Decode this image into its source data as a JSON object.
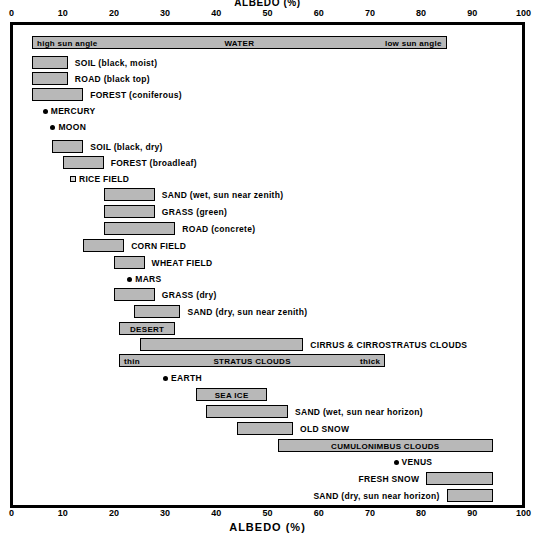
{
  "titles": {
    "top": "ALBEDO (%)",
    "bottom": "ALBEDO (%)"
  },
  "axis": {
    "label": "ALBEDO (%)",
    "ticks": [
      0,
      10,
      20,
      30,
      40,
      50,
      60,
      70,
      80,
      90,
      100
    ],
    "min": 0,
    "max": 100,
    "unit": "%"
  },
  "colors": {
    "bar_fill": "#b8b8b8",
    "bar_border": "#000000",
    "background": "#ffffff",
    "text": "#000000"
  },
  "chart_data": {
    "type": "bar",
    "orientation": "horizontal",
    "title": "ALBEDO (%)",
    "xlabel": "ALBEDO (%)",
    "ylabel": "",
    "xlim": [
      0,
      100
    ],
    "grid": false,
    "legend": null,
    "note": "Horizontal range (floating) bar chart of albedo percentages for surfaces, clouds and planets. Planets are single-value point markers.",
    "categories": [
      "WATER",
      "SOIL (black, moist)",
      "ROAD (black top)",
      "FOREST (coniferous)",
      "MERCURY",
      "MOON",
      "SOIL (black, dry)",
      "FOREST (broadleaf)",
      "RICE FIELD",
      "SAND (wet, sun near zenith)",
      "GRASS (green)",
      "ROAD (concrete)",
      "CORN FIELD",
      "WHEAT FIELD",
      "MARS",
      "GRASS (dry)",
      "SAND (dry, sun near zenith)",
      "DESERT",
      "CIRRUS & CIRROSTRATUS CLOUDS",
      "STRATUS CLOUDS",
      "EARTH",
      "SEA ICE",
      "SAND (wet, sun near horizon)",
      "OLD SNOW",
      "CUMULONIMBUS CLOUDS",
      "VENUS",
      "FRESH SNOW",
      "SAND (dry, sun near horizon)"
    ],
    "ranges": [
      [
        4,
        85
      ],
      [
        4,
        11
      ],
      [
        4,
        11
      ],
      [
        4,
        14
      ],
      [
        6.5,
        6.5
      ],
      [
        8,
        8
      ],
      [
        8,
        14
      ],
      [
        10,
        18
      ],
      [
        12,
        12
      ],
      [
        18,
        28
      ],
      [
        18,
        28
      ],
      [
        18,
        32
      ],
      [
        14,
        22
      ],
      [
        20,
        26
      ],
      [
        23,
        23
      ],
      [
        20,
        28
      ],
      [
        24,
        33
      ],
      [
        21,
        32
      ],
      [
        25,
        57
      ],
      [
        21,
        73
      ],
      [
        30,
        30
      ],
      [
        36,
        50
      ],
      [
        38,
        54
      ],
      [
        44,
        55
      ],
      [
        52,
        94
      ],
      [
        75,
        75
      ],
      [
        81,
        94
      ],
      [
        85,
        94
      ]
    ],
    "values": [
      44.5,
      7.5,
      7.5,
      9,
      6.5,
      8,
      11,
      14,
      12,
      23,
      23,
      25,
      18,
      23,
      23,
      24,
      28.5,
      26.5,
      41,
      47,
      30,
      43,
      46,
      49.5,
      73,
      75,
      87.5,
      89.5
    ]
  },
  "rows": [
    {
      "name": "water",
      "type": "bar",
      "start": 4,
      "end": 85,
      "y": 36,
      "label": "WATER",
      "label_pos": "center-inside",
      "sub_left": "high sun angle",
      "sub_right": "low sun angle",
      "dashed_mid": true
    },
    {
      "name": "soil-black-moist",
      "type": "bar",
      "start": 4,
      "end": 11,
      "y": 56,
      "label": "SOIL  (black, moist)",
      "label_pos": "after"
    },
    {
      "name": "road-black-top",
      "type": "bar",
      "start": 4,
      "end": 11,
      "y": 72,
      "label": "ROAD  (black top)",
      "label_pos": "after"
    },
    {
      "name": "forest-coniferous",
      "type": "bar",
      "start": 4,
      "end": 14,
      "y": 88,
      "label": "FOREST  (coniferous)",
      "label_pos": "after"
    },
    {
      "name": "mercury",
      "type": "dot",
      "start": 6.5,
      "end": 6.5,
      "y": 104,
      "label": "MERCURY",
      "label_pos": "after"
    },
    {
      "name": "moon",
      "type": "dot",
      "start": 8,
      "end": 8,
      "y": 120,
      "label": "MOON",
      "label_pos": "after"
    },
    {
      "name": "soil-black-dry",
      "type": "bar",
      "start": 8,
      "end": 14,
      "y": 140,
      "label": "SOIL  (black, dry)",
      "label_pos": "after"
    },
    {
      "name": "forest-broadleaf",
      "type": "bar",
      "start": 10,
      "end": 18,
      "y": 156,
      "label": "FOREST  (broadleaf)",
      "label_pos": "after"
    },
    {
      "name": "rice-field",
      "type": "square",
      "start": 12,
      "end": 12,
      "y": 172,
      "label": "RICE FIELD",
      "label_pos": "after"
    },
    {
      "name": "sand-wet-zenith",
      "type": "bar",
      "start": 18,
      "end": 28,
      "y": 188,
      "label": "SAND  (wet, sun near zenith)",
      "label_pos": "after"
    },
    {
      "name": "grass-green",
      "type": "bar",
      "start": 18,
      "end": 28,
      "y": 205,
      "label": "GRASS  (green)",
      "label_pos": "after"
    },
    {
      "name": "road-concrete",
      "type": "bar",
      "start": 18,
      "end": 32,
      "y": 222,
      "label": "ROAD  (concrete)",
      "label_pos": "after"
    },
    {
      "name": "corn-field",
      "type": "bar",
      "start": 14,
      "end": 22,
      "y": 239,
      "label": "CORN FIELD",
      "label_pos": "after"
    },
    {
      "name": "wheat-field",
      "type": "bar",
      "start": 20,
      "end": 26,
      "y": 256,
      "label": "WHEAT FIELD",
      "label_pos": "after"
    },
    {
      "name": "mars",
      "type": "dot",
      "start": 23,
      "end": 23,
      "y": 272,
      "label": "MARS",
      "label_pos": "after"
    },
    {
      "name": "grass-dry",
      "type": "bar",
      "start": 20,
      "end": 28,
      "y": 288,
      "label": "GRASS  (dry)",
      "label_pos": "after"
    },
    {
      "name": "sand-dry-zenith",
      "type": "bar",
      "start": 24,
      "end": 33,
      "y": 305,
      "label": "SAND  (dry, sun near zenith)",
      "label_pos": "after"
    },
    {
      "name": "desert",
      "type": "bar",
      "start": 21,
      "end": 32,
      "y": 322,
      "label": "DESERT",
      "label_pos": "center-inside"
    },
    {
      "name": "cirrus-cirrostratus-clouds",
      "type": "bar",
      "start": 25,
      "end": 57,
      "y": 338,
      "label": "CIRRUS & CIRROSTRATUS CLOUDS",
      "label_pos": "after"
    },
    {
      "name": "stratus-clouds",
      "type": "bar",
      "start": 21,
      "end": 73,
      "y": 354,
      "label": "STRATUS CLOUDS",
      "label_pos": "center-inside",
      "sub_left": "thin",
      "sub_right": "thick"
    },
    {
      "name": "earth",
      "type": "dot",
      "start": 30,
      "end": 30,
      "y": 371,
      "label": "EARTH",
      "label_pos": "after"
    },
    {
      "name": "sea-ice",
      "type": "bar",
      "start": 36,
      "end": 50,
      "y": 388,
      "label": "SEA ICE",
      "label_pos": "center-inside"
    },
    {
      "name": "sand-wet-horizon",
      "type": "bar",
      "start": 38,
      "end": 54,
      "y": 405,
      "label": "SAND  (wet, sun near horizon)",
      "label_pos": "after"
    },
    {
      "name": "old-snow",
      "type": "bar",
      "start": 44,
      "end": 55,
      "y": 422,
      "label": "OLD SNOW",
      "label_pos": "after"
    },
    {
      "name": "cumulonimbus-clouds",
      "type": "bar",
      "start": 52,
      "end": 94,
      "y": 439,
      "label": "CUMULONIMBUS CLOUDS",
      "label_pos": "center-inside"
    },
    {
      "name": "venus",
      "type": "dot",
      "start": 75,
      "end": 75,
      "y": 455,
      "label": "VENUS",
      "label_pos": "after"
    },
    {
      "name": "fresh-snow",
      "type": "bar",
      "start": 81,
      "end": 94,
      "y": 472,
      "label": "FRESH SNOW",
      "label_pos": "before"
    },
    {
      "name": "sand-dry-horizon",
      "type": "bar",
      "start": 85,
      "end": 94,
      "y": 489,
      "label": "SAND  (dry, sun near horizon)",
      "label_pos": "before"
    }
  ]
}
